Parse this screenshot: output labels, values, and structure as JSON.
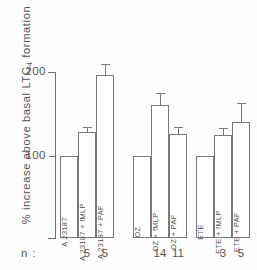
{
  "chart_data": {
    "type": "bar",
    "title": "",
    "xlabel": "",
    "ylabel": "% increase above basal LTC",
    "ylabel_sub": "4",
    "ylabel_tail": " formation",
    "ylim": [
      0,
      215
    ],
    "grid": false,
    "legend": "none",
    "y_ticks": [
      {
        "value": 100,
        "label": "100"
      },
      {
        "value": 200,
        "label": "200"
      }
    ],
    "baseline": 100,
    "n_row_label": "n :",
    "groups": [
      {
        "name": "A 23187",
        "bars": [
          {
            "label": "A 23187",
            "value": 100,
            "error": null,
            "n": null
          },
          {
            "label": "A 23187 + fMLP",
            "value": 128,
            "error": 7,
            "n": "5"
          },
          {
            "label": "A 23187 + PAF",
            "value": 196,
            "error": 14,
            "n": "5"
          }
        ]
      },
      {
        "name": "OZ",
        "bars": [
          {
            "label": "OZ",
            "value": 100,
            "error": null,
            "n": null
          },
          {
            "label": "OZ + fMLP",
            "value": 161,
            "error": 14,
            "n": "14"
          },
          {
            "label": "OZ + PAF",
            "value": 126,
            "error": 8,
            "n": "11"
          }
        ]
      },
      {
        "name": "ETE",
        "bars": [
          {
            "label": "ETE",
            "value": 100,
            "error": null,
            "n": null
          },
          {
            "label": "ETE + fMLP",
            "value": 125,
            "error": 8,
            "n": "3"
          },
          {
            "label": "ETE + PAF",
            "value": 141,
            "error": 22,
            "n": "5"
          }
        ]
      }
    ]
  }
}
